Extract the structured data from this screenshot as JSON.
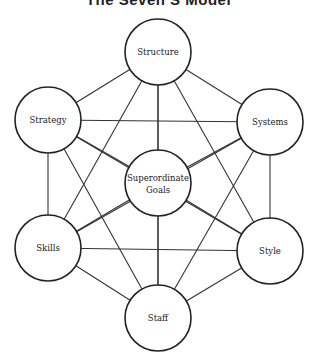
{
  "title": "The Seven S Model",
  "nodes": [
    {
      "id": "structure",
      "label": "Structure",
      "cx": 158,
      "cy": 52,
      "r": 33
    },
    {
      "id": "strategy",
      "label": "Strategy",
      "cx": 48,
      "cy": 120,
      "r": 33
    },
    {
      "id": "systems",
      "label": "Systems",
      "cx": 270,
      "cy": 122,
      "r": 33
    },
    {
      "id": "superordinate-goals",
      "label": "Superordinate Goals",
      "line1": "Superordinate",
      "line2": "Goals",
      "cx": 158,
      "cy": 183,
      "r": 33
    },
    {
      "id": "skills",
      "label": "Skills",
      "cx": 48,
      "cy": 248,
      "r": 33
    },
    {
      "id": "style",
      "label": "Style",
      "cx": 270,
      "cy": 251,
      "r": 33
    },
    {
      "id": "staff",
      "label": "Staff",
      "cx": 158,
      "cy": 318,
      "r": 33
    }
  ],
  "edges": "all pairs connected"
}
